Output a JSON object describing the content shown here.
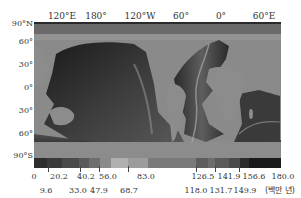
{
  "map": {
    "title": "Seafloor age map",
    "longitude_labels": [
      {
        "label": "120°E",
        "x": 62
      },
      {
        "label": "180°",
        "x": 96
      },
      {
        "label": "120°W",
        "x": 140
      },
      {
        "label": "60°",
        "x": 181
      },
      {
        "label": "0°",
        "x": 221
      },
      {
        "label": "60°E",
        "x": 264
      }
    ],
    "latitude_labels": [
      {
        "label": "90°N",
        "y": 19
      },
      {
        "label": "60°",
        "y": 37
      },
      {
        "label": "30°",
        "y": 60
      },
      {
        "label": "0°",
        "y": 83
      },
      {
        "label": "30°",
        "y": 106
      },
      {
        "label": "60°",
        "y": 129
      },
      {
        "label": "90°S",
        "y": 151
      }
    ],
    "land_color": "#8c8c8c",
    "ocean_dark": "#1c1c1c"
  },
  "colorbar": {
    "unit": "(백만 년)",
    "segments": [
      {
        "from": 0,
        "to": 9.6,
        "color": "#2e2e2e"
      },
      {
        "from": 9.6,
        "to": 20.2,
        "color": "#3a3a3a"
      },
      {
        "from": 20.2,
        "to": 33.0,
        "color": "#4a4a4a"
      },
      {
        "from": 33.0,
        "to": 40.2,
        "color": "#5a5a5a"
      },
      {
        "from": 40.2,
        "to": 47.9,
        "color": "#6e6e6e"
      },
      {
        "from": 47.9,
        "to": 56.0,
        "color": "#8a8a8a"
      },
      {
        "from": 56.0,
        "to": 68.7,
        "color": "#b0b0b0"
      },
      {
        "from": 68.7,
        "to": 83.0,
        "color": "#9c9c9c"
      },
      {
        "from": 83.0,
        "to": 118.0,
        "color": "#7a7a7a"
      },
      {
        "from": 118.0,
        "to": 126.5,
        "color": "#5e5e5e"
      },
      {
        "from": 126.5,
        "to": 131.7,
        "color": "#6c6c6c"
      },
      {
        "from": 131.7,
        "to": 141.9,
        "color": "#5a5a5a"
      },
      {
        "from": 141.9,
        "to": 149.9,
        "color": "#4a4a4a"
      },
      {
        "from": 149.9,
        "to": 156.6,
        "color": "#2c2c2c"
      },
      {
        "from": 156.6,
        "to": 180.0,
        "color": "#1a1a1a"
      }
    ],
    "top_labels": [
      {
        "label": "0",
        "x": 34
      },
      {
        "label": "20.2",
        "x": 59
      },
      {
        "label": "40.2",
        "x": 86
      },
      {
        "label": "56.0",
        "x": 108
      },
      {
        "label": "83.0",
        "x": 146
      },
      {
        "label": "126.5",
        "x": 203
      },
      {
        "label": "141.9",
        "x": 229
      },
      {
        "label": "156.6",
        "x": 254
      },
      {
        "label": "180.0",
        "x": 283
      }
    ],
    "bottom_labels": [
      {
        "label": "9.6",
        "x": 46
      },
      {
        "label": "33.0",
        "x": 78
      },
      {
        "label": "47.9",
        "x": 99
      },
      {
        "label": "68.7",
        "x": 129
      },
      {
        "label": "118.0",
        "x": 196
      },
      {
        "label": "131.7",
        "x": 221
      },
      {
        "label": "149.9",
        "x": 245
      }
    ],
    "arrow_positions": [
      48,
      80,
      99,
      128,
      196,
      215,
      239
    ]
  }
}
